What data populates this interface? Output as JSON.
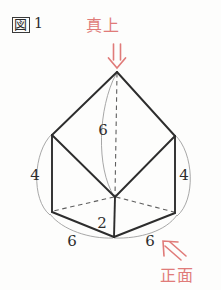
{
  "figure": {
    "label_boxed": "図",
    "label_number": "1",
    "caption_full": "図 1"
  },
  "annotations": {
    "top_view": {
      "text": "真上",
      "icon": "double-down-arrow-icon",
      "color": "#e07b79"
    },
    "front_view": {
      "text": "正面",
      "icon": "double-up-left-arrow-icon",
      "color": "#e07b79"
    }
  },
  "dimensions": [
    {
      "name": "height-center",
      "value": "6",
      "x": 103,
      "y": 135
    },
    {
      "name": "left-vertical-edge",
      "value": "4",
      "x": 35,
      "y": 180
    },
    {
      "name": "right-vertical-edge",
      "value": "4",
      "x": 184,
      "y": 180
    },
    {
      "name": "center-short-edge",
      "value": "2",
      "x": 100,
      "y": 228
    },
    {
      "name": "bottom-left-edge",
      "value": "6",
      "x": 72,
      "y": 243
    },
    {
      "name": "bottom-right-edge",
      "value": "6",
      "x": 148,
      "y": 243
    }
  ],
  "geometry": {
    "type": "solid-figure-diagram",
    "description": "hexagonal-based solid with apex above center",
    "vertices": {
      "apex": [
        117,
        72
      ],
      "upper_left": [
        52,
        135
      ],
      "upper_right": [
        175,
        136
      ],
      "lower_left": [
        52,
        212
      ],
      "lower_right": [
        175,
        213
      ],
      "front_bottom": [
        114,
        237
      ],
      "center_inner": [
        115,
        197
      ]
    },
    "solid_edges": [
      [
        "apex",
        "upper_left"
      ],
      [
        "apex",
        "upper_right"
      ],
      [
        "upper_left",
        "lower_left"
      ],
      [
        "upper_right",
        "lower_right"
      ],
      [
        "lower_left",
        "front_bottom"
      ],
      [
        "lower_right",
        "front_bottom"
      ],
      [
        "upper_left",
        "center_inner"
      ],
      [
        "upper_right",
        "center_inner"
      ],
      [
        "center_inner",
        "front_bottom"
      ]
    ],
    "hidden_edges": [
      [
        "apex",
        "center_inner"
      ],
      [
        "lower_left",
        "center_inner"
      ],
      [
        "lower_right",
        "center_inner"
      ]
    ],
    "measure_arcs": [
      {
        "name": "height-arc",
        "label": "6"
      },
      {
        "name": "left-arc",
        "label": "4"
      },
      {
        "name": "right-arc",
        "label": "4"
      },
      {
        "name": "bottom-left-arc",
        "label": "6"
      },
      {
        "name": "bottom-right-arc",
        "label": "6"
      }
    ]
  },
  "colors": {
    "ink": "#2d2d2d",
    "hidden": "#6d6d6d",
    "arc": "#9a9a9a",
    "annotation": "#e07b79",
    "background": "#fdfdfc"
  }
}
